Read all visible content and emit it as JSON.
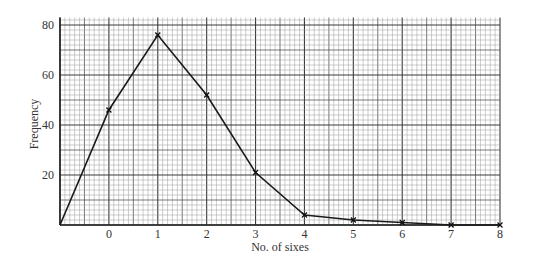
{
  "chart_data": {
    "type": "line",
    "title": "",
    "xlabel": "No. of sixes",
    "ylabel": "Frequency",
    "x": [
      -1,
      0,
      1,
      2,
      3,
      4,
      5,
      6,
      7,
      8
    ],
    "series": [
      {
        "name": "Frequency polygon",
        "values": [
          0,
          46,
          76,
          52,
          21,
          4,
          2,
          1,
          0,
          0
        ]
      }
    ],
    "marked_points_x": [
      0,
      1,
      2,
      3,
      4,
      5,
      6,
      7,
      8
    ],
    "xticks": [
      "0",
      "1",
      "2",
      "3",
      "4",
      "5",
      "6",
      "7",
      "8"
    ],
    "yticks": [
      "20",
      "40",
      "60",
      "80"
    ],
    "xlim": [
      -1,
      8
    ],
    "ylim": [
      0,
      83
    ],
    "grid": true,
    "grid_style": "graph paper: minor lines every 0.1 x-unit / 2 y-units, major every 1 x-unit / 20 y-units",
    "legend": null,
    "colors": {
      "line": "#1a1a1a",
      "grid_minor": "#9a9a9a",
      "grid_major": "#3a3a3a",
      "background": "#ffffff"
    }
  }
}
